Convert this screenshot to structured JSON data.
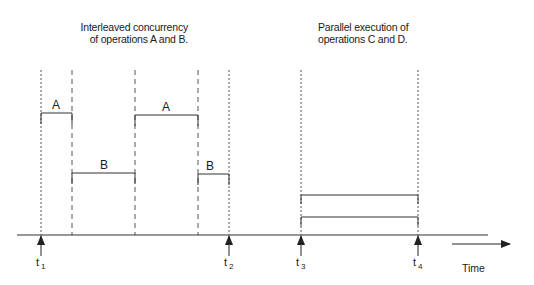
{
  "titles": {
    "interleaved": [
      "Interleaved concurrency",
      "of operations A and B."
    ],
    "parallel": [
      "Parallel execution of",
      "operations C and D."
    ]
  },
  "timeline": {
    "axis_label": "Time",
    "markers": [
      {
        "name": "t",
        "sub": "1",
        "x": 41
      },
      {
        "name": "t",
        "sub": "2",
        "x": 229
      },
      {
        "name": "t",
        "sub": "3",
        "x": 301
      },
      {
        "name": "t",
        "sub": "4",
        "x": 418
      }
    ]
  },
  "interleaved_segments": [
    {
      "op": "A",
      "start_x": 41,
      "end_x": 72,
      "top_y": 113
    },
    {
      "op": "B",
      "start_x": 72,
      "end_x": 135,
      "top_y": 173
    },
    {
      "op": "A",
      "start_x": 135,
      "end_x": 198,
      "top_y": 115
    },
    {
      "op": "B",
      "start_x": 198,
      "end_x": 229,
      "top_y": 174
    }
  ],
  "parallel_segments": [
    {
      "op": "C",
      "start_x": 301,
      "end_x": 418,
      "top_y": 195
    },
    {
      "op": "D",
      "start_x": 301,
      "end_x": 418,
      "top_y": 217
    }
  ],
  "colors": {
    "line": "#333333",
    "text": "#1a1a1a",
    "background": "#ffffff"
  }
}
